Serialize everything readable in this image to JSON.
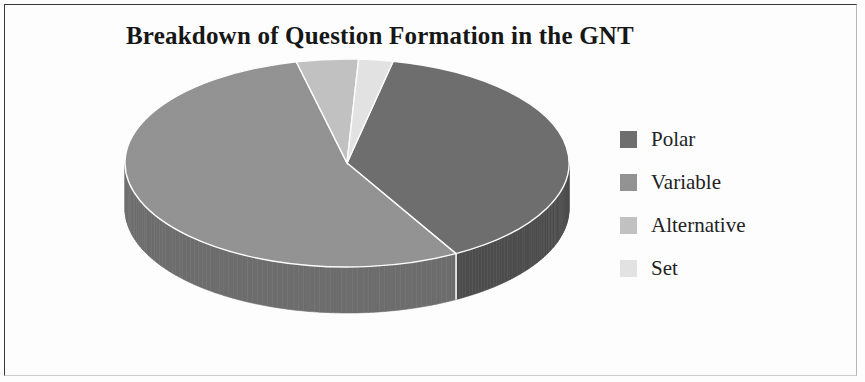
{
  "figure": {
    "background_color": "#ffffff",
    "border_color": "#3a3a3a"
  },
  "chart_data": {
    "type": "pie",
    "title": "Breakdown of Question Formation in the GNT",
    "subtitle": "",
    "xlabel": "",
    "ylabel": "",
    "categories": [
      "Polar",
      "Variable",
      "Alternative",
      "Set"
    ],
    "values": [
      38.5,
      54.5,
      4.5,
      2.5
    ],
    "units": "percent",
    "three_d": true,
    "start_angle_deg": 12,
    "direction": "clockwise",
    "legend_position": "right",
    "grid": false,
    "data_labels_shown": false,
    "series": [
      {
        "name": "Question Formation",
        "values": [
          38.5,
          54.5,
          4.5,
          2.5
        ]
      }
    ],
    "slices": [
      {
        "label": "Polar",
        "value": 38.5,
        "color": "#6f6f6f",
        "side_color": "#4e4e4e",
        "start_deg": 12,
        "end_deg": 150.6
      },
      {
        "label": "Variable",
        "value": 54.5,
        "color": "#949494",
        "side_color": "#6e6e6e",
        "start_deg": 150.6,
        "end_deg": 346.8
      },
      {
        "label": "Alternative",
        "value": 4.5,
        "color": "#c3c3c3",
        "side_color": "#9a9a9a",
        "start_deg": 346.8,
        "end_deg": 363.0
      },
      {
        "label": "Set",
        "value": 2.5,
        "color": "#e4e4e4",
        "side_color": "#b9b9b9",
        "start_deg": 363.0,
        "end_deg": 372.0
      }
    ]
  },
  "legend": {
    "items": [
      {
        "label": "Polar",
        "color": "#6f6f6f"
      },
      {
        "label": "Variable",
        "color": "#949494"
      },
      {
        "label": "Alternative",
        "color": "#c3c3c3"
      },
      {
        "label": "Set",
        "color": "#e4e4e4"
      }
    ]
  }
}
